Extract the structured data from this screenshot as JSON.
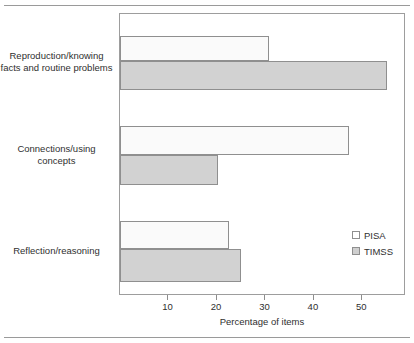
{
  "chart_data": {
    "type": "bar",
    "orientation": "horizontal",
    "title": "",
    "xlabel": "Percentage of items",
    "ylabel": "",
    "categories": [
      "Reproduction/knowing facts and routine problems",
      "Connections/using concepts",
      "Reflection/reasoning"
    ],
    "category_lines": [
      [
        "Reproduction/knowing",
        "facts and routine problems"
      ],
      [
        "Connections/using",
        "concepts"
      ],
      [
        "Reflection/reasoning"
      ]
    ],
    "series": [
      {
        "name": "PISA",
        "values": [
          30.8,
          47.2,
          22.5
        ],
        "color": "#fafafa"
      },
      {
        "name": "TIMSS",
        "values": [
          55.0,
          20.2,
          25.0
        ],
        "color": "#d2d2d2"
      }
    ],
    "xlim": [
      0,
      59
    ],
    "xticks": [
      10,
      20,
      30,
      40,
      50
    ],
    "xtick_labels": [
      "10",
      "20",
      "30",
      "40",
      "50"
    ],
    "grid": false,
    "legend_position": "inside-right"
  },
  "legend": {
    "items": [
      {
        "label": "PISA"
      },
      {
        "label": "TIMSS"
      }
    ]
  },
  "axis": {
    "xlabel": "Percentage of items"
  }
}
